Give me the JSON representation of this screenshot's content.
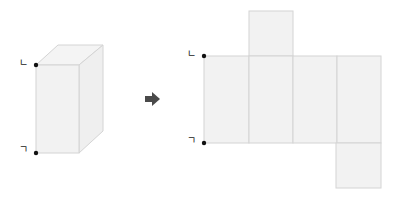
{
  "colors": {
    "face_fill": "#f2f2f2",
    "edge": "#d4d4d4",
    "point": "#111111",
    "arrow": "#4a4a4a"
  },
  "prism": {
    "label_top": "ㄴ",
    "label_bottom": "ㄱ"
  },
  "net": {
    "label_top": "ㄴ",
    "label_bottom": "ㄱ",
    "faces": 6
  },
  "arrow": {
    "icon": "right-arrow-icon"
  }
}
